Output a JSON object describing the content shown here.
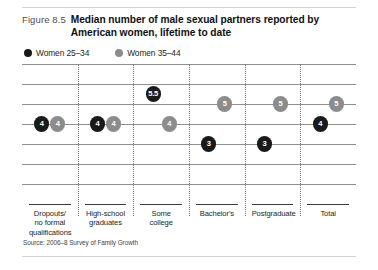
{
  "figure": {
    "number_label": "Figure 8.5",
    "title": "Median number of male sexual partners reported by American women, lifetime to date",
    "source": "Source: 2006–8 Survey of Family Growth"
  },
  "legend": {
    "position": "top-left",
    "items": [
      {
        "label": "Women 25–34",
        "color": "#1a1a1a",
        "icon": "legend-dot-icon"
      },
      {
        "label": "Women 35–44",
        "color": "#8c8c8c",
        "icon": "legend-dot-icon"
      }
    ]
  },
  "colors": {
    "series_dark": "#1a1a1a",
    "series_gray": "#8c8c8c",
    "gridline": "#8f8f8f",
    "separator": "#7a7a7a",
    "rule": "#d2d2d2",
    "text": "#231f20"
  },
  "chart_data": {
    "type": "scatter",
    "title": "Median number of male sexual partners reported by American women, lifetime to date",
    "subtitle": "",
    "xlabel": "",
    "ylabel": "",
    "grid": true,
    "legend_position": "top-left",
    "ylim": [
      0,
      7
    ],
    "yticks": [
      0,
      1,
      2,
      3,
      4,
      5,
      6,
      7
    ],
    "categories": [
      "Dropouts/ no formal qualifications",
      "High-school graduates",
      "Some college",
      "Bachelor's",
      "Postgraduate",
      "Total"
    ],
    "category_lines": [
      [
        "Dropouts/",
        "no formal",
        "qualifications"
      ],
      [
        "High-school",
        "graduates"
      ],
      [
        "Some",
        "college"
      ],
      [
        "Bachelor's"
      ],
      [
        "Postgraduate"
      ],
      [
        "Total"
      ]
    ],
    "series": [
      {
        "name": "Women 25–34",
        "color": "#1a1a1a",
        "values": [
          4,
          4,
          5.5,
          3,
          3,
          4
        ],
        "labels": [
          "4",
          "4",
          "5.5",
          "3",
          "3",
          "4"
        ]
      },
      {
        "name": "Women 35–44",
        "color": "#8c8c8c",
        "values": [
          4,
          4,
          4,
          5,
          5,
          5
        ],
        "labels": [
          "4",
          "4",
          "4",
          "5",
          "5",
          "5"
        ]
      }
    ]
  }
}
